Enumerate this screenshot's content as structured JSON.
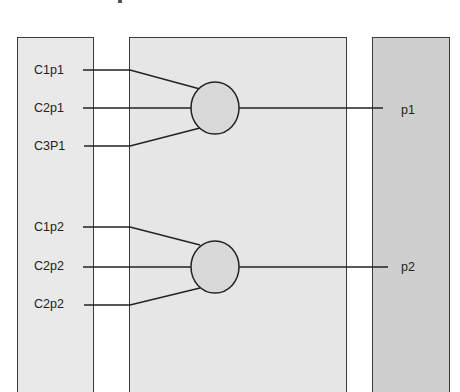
{
  "diagram": {
    "colors": {
      "left_panel": "#e9e9e9",
      "middle_panel": "#e6e6e6",
      "right_panel": "#cfcfcf",
      "ellipse_fill": "#d9d9d9",
      "stroke": "#222222"
    },
    "left_panel": {
      "groups": [
        {
          "inputs": [
            "C1p1",
            "C2p1",
            "C3P1"
          ]
        },
        {
          "inputs": [
            "C1p2",
            "C2p2",
            "C2p2"
          ]
        }
      ]
    },
    "right_panel": {
      "outputs": [
        "p1",
        "p2"
      ]
    }
  }
}
